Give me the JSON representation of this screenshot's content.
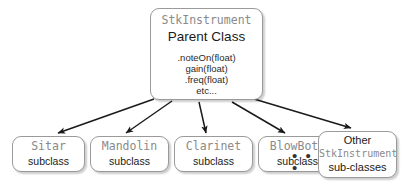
{
  "diagram": {
    "type": "uml-class-hierarchy",
    "background_color": "#ffffff",
    "accent_mono_color": "#8a8a8a",
    "text_color": "#1a1a1a",
    "border_color": "#9a9a9a",
    "arrow_color": "#1a1a1a"
  },
  "parent": {
    "class_name": "StkInstrument",
    "role": "Parent Class",
    "methods": [
      ".noteOn(float)",
      "gain(float)",
      ".freq(float)",
      "etc..."
    ]
  },
  "subclasses": [
    {
      "class_name": "Sitar",
      "role": "subclass"
    },
    {
      "class_name": "Mandolin",
      "role": "subclass"
    },
    {
      "class_name": "Clarinet",
      "role": "subclass"
    },
    {
      "class_name": "BlowBotl",
      "role": "subclass"
    }
  ],
  "ellipsis": {
    "label": "• • •"
  },
  "other": {
    "line_1": "Other",
    "line_2": "StkInstrument",
    "line_3": "sub-classes"
  }
}
